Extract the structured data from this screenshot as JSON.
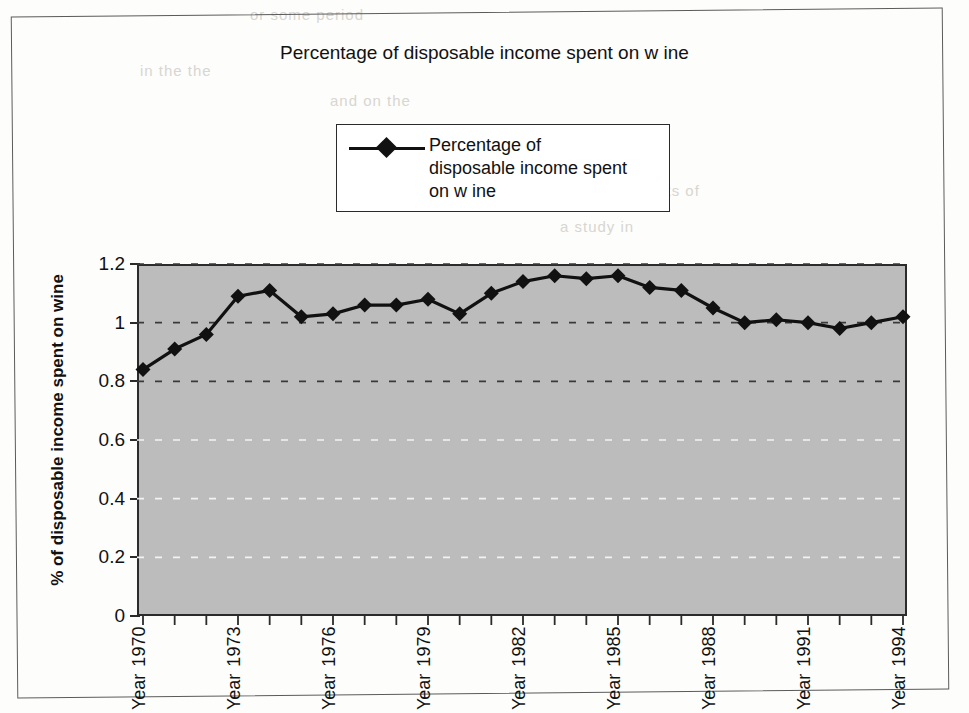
{
  "chart_data": {
    "type": "line",
    "title": "Percentage of disposable income spent on w ine",
    "xlabel": "",
    "ylabel": "% of disposable income spent on wine",
    "legend": {
      "position": "top-center",
      "entries": [
        "Percentage of\ndisposable income spent\non w ine"
      ]
    },
    "grid": true,
    "ylim": [
      0,
      1.2
    ],
    "y_ticks": [
      0,
      0.2,
      0.4,
      0.6,
      0.8,
      1,
      1.2
    ],
    "y_tick_labels": [
      "0",
      "0.2",
      "0.4",
      "0.6",
      "0.8",
      "1",
      "1.2"
    ],
    "categories": [
      "Year 1970",
      "1971",
      "1972",
      "Year 1973",
      "1974",
      "1975",
      "Year 1976",
      "1977",
      "1978",
      "Year 1979",
      "1980",
      "1981",
      "Year 1982",
      "1983",
      "1984",
      "Year 1985",
      "1986",
      "1987",
      "Year 1988",
      "1989",
      "1990",
      "Year 1991",
      "1992",
      "1993",
      "Year 1994"
    ],
    "x_tick_labels": [
      "Year 1970",
      "",
      "",
      "Year 1973",
      "",
      "",
      "Year 1976",
      "",
      "",
      "Year 1979",
      "",
      "",
      "Year 1982",
      "",
      "",
      "Year 1985",
      "",
      "",
      "Year 1988",
      "",
      "",
      "Year 1991",
      "",
      "",
      "Year 1994"
    ],
    "series": [
      {
        "name": "Percentage of disposable income spent on wine",
        "marker": "diamond",
        "color": "#111111",
        "values": [
          0.84,
          0.91,
          0.96,
          1.09,
          1.11,
          1.02,
          1.03,
          1.06,
          1.06,
          1.08,
          1.03,
          1.1,
          1.14,
          1.16,
          1.15,
          1.16,
          1.12,
          1.11,
          1.05,
          1.0,
          1.01,
          1.0,
          0.98,
          1.0,
          1.02
        ]
      }
    ],
    "plot_background": "#bcbcbc",
    "axis_color": "#2b2b2b"
  },
  "bleed_text": {
    "lines": [
      "or some period",
      "in the the",
      "and on the",
      "the results of",
      "a study in"
    ]
  }
}
